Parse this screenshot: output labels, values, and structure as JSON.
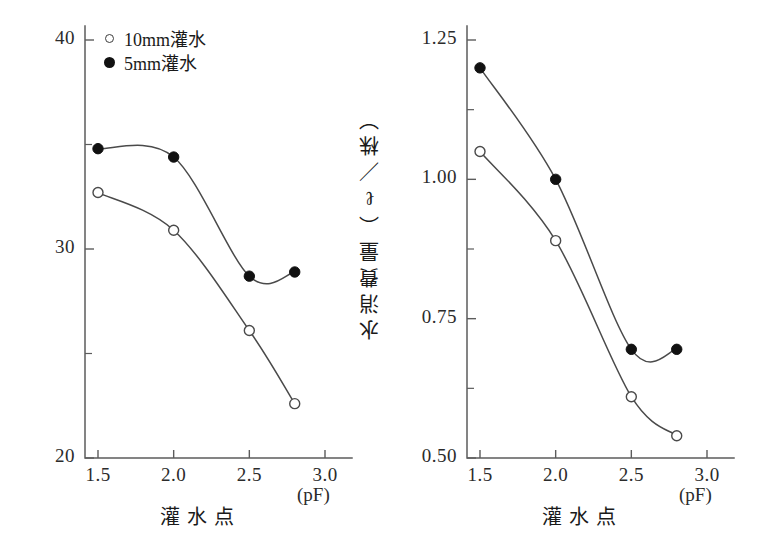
{
  "figure": {
    "legend": {
      "entries": [
        {
          "marker": "open-circle-marker",
          "label": "10mm灌水",
          "series_key": "irrigation_10mm"
        },
        {
          "marker": "filled-circle-marker",
          "label": "5mm灌水",
          "series_key": "irrigation_5mm"
        }
      ]
    },
    "colors": {
      "axis": "#5c5c5c",
      "curve": "#4a4a4a",
      "filled_marker": "#111111",
      "open_marker_fill": "#ffffff",
      "text": "#1a1a1a",
      "background": "#ffffff"
    }
  },
  "chart_data": [
    {
      "panel": "left",
      "type": "line",
      "title": "",
      "xlabel": "灌水点",
      "xunit": "(pF)",
      "ylabel": "切り花重（g）",
      "x": [
        1.5,
        2.0,
        2.5,
        2.8
      ],
      "xlim": [
        1.35,
        3.05
      ],
      "ylim": [
        20,
        40
      ],
      "xticks": [
        1.5,
        2.0,
        2.5,
        3.0
      ],
      "xticklabels": [
        "1.5",
        "2.0",
        "2.5",
        "3.0"
      ],
      "yticks": [
        20,
        30,
        40
      ],
      "yticklabels": [
        "20",
        "30",
        "40"
      ],
      "yminorticks": [
        25,
        35
      ],
      "grid": false,
      "legend_position": "upper-left",
      "series": [
        {
          "name": "5mm灌水",
          "marker": "filled-circle",
          "values": [
            34.8,
            34.4,
            28.7,
            28.9
          ]
        },
        {
          "name": "10mm灌水",
          "marker": "open-circle",
          "values": [
            32.7,
            30.9,
            26.1,
            22.6
          ]
        }
      ]
    },
    {
      "panel": "right",
      "type": "line",
      "title": "",
      "xlabel": "灌水点",
      "xunit": "(pF)",
      "ylabel": "水消費量（ℓ／株）",
      "x": [
        1.5,
        2.0,
        2.5,
        2.8
      ],
      "xlim": [
        1.35,
        3.05
      ],
      "ylim": [
        0.5,
        1.3
      ],
      "xticks": [
        1.5,
        2.0,
        2.5,
        3.0
      ],
      "xticklabels": [
        "1.5",
        "2.0",
        "2.5",
        "3.0"
      ],
      "yticks": [
        0.5,
        0.75,
        1.0,
        1.25
      ],
      "yticklabels": [
        "0.50",
        "0.75",
        "1.00",
        "1.25"
      ],
      "yminorticks": [
        0.625,
        0.875,
        1.125
      ],
      "grid": false,
      "legend_position": "none",
      "series": [
        {
          "name": "5mm灌水",
          "marker": "filled-circle",
          "values": [
            1.2,
            1.0,
            0.695,
            0.695
          ]
        },
        {
          "name": "10mm灌水",
          "marker": "open-circle",
          "values": [
            1.05,
            0.89,
            0.61,
            0.54
          ]
        }
      ]
    }
  ]
}
